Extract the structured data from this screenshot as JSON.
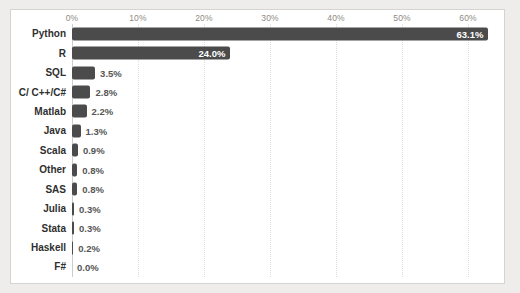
{
  "page": {
    "background": "#eeedeb",
    "panel_background": "#ffffff",
    "panel_border": "#d6d4d1"
  },
  "chart_data": {
    "type": "bar",
    "orientation": "horizontal",
    "title": "",
    "xlabel": "",
    "ylabel": "",
    "categories": [
      "Python",
      "R",
      "SQL",
      "C/ C++/C#",
      "Matlab",
      "Java",
      "Scala",
      "Other",
      "SAS",
      "Julia",
      "Stata",
      "Haskell",
      "F#"
    ],
    "values": [
      63.1,
      24.0,
      3.5,
      2.8,
      2.2,
      1.3,
      0.9,
      0.8,
      0.8,
      0.3,
      0.3,
      0.2,
      0.0
    ],
    "value_labels": [
      "63.1%",
      "24.0%",
      "3.5%",
      "2.8%",
      "2.2%",
      "1.3%",
      "0.9%",
      "0.8%",
      "0.8%",
      "0.3%",
      "0.3%",
      "0.2%",
      "0.0%"
    ],
    "x_ticks": [
      "0%",
      "10%",
      "20%",
      "30%",
      "40%",
      "50%",
      "60%"
    ],
    "x_tick_values": [
      0,
      10,
      20,
      30,
      40,
      50,
      60
    ],
    "xlim": [
      0,
      65.6
    ],
    "grid": "vertical-dotted",
    "legend": "none",
    "bar_color": "#4b4b4b",
    "tick_color": "#8e8a85",
    "category_label_color": "#2f2f2f",
    "inside_label_color": "#ffffff",
    "outside_label_color": "#565656",
    "axis_line_color": "#cccccc",
    "gridline_color": "#e0dedc"
  }
}
